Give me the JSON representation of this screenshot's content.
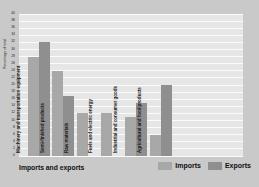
{
  "chart_data": {
    "type": "bar",
    "title": "Imports and exports",
    "xlabel": "",
    "ylabel": "Percentage of total",
    "ylim": [
      0,
      40
    ],
    "ytick_step": 2,
    "yticks": [
      0,
      2,
      4,
      6,
      8,
      10,
      12,
      14,
      16,
      18,
      20,
      22,
      24,
      26,
      28,
      30,
      32,
      34,
      36,
      38,
      40
    ],
    "ytick_labels": [
      "0",
      "2",
      "4",
      "6",
      "8",
      "10",
      "12",
      "14",
      "16",
      "18",
      "20",
      "22",
      "24",
      "26",
      "28",
      "30",
      "32",
      "34",
      "36",
      "38",
      "40"
    ],
    "grid": true,
    "grid_orientation": "horizontal",
    "legend": [
      "Imports",
      "Exports"
    ],
    "legend_position": "bottom-right",
    "categories": [
      "Machinery and transportation equipment",
      "Semi-finished products",
      "Raw materials",
      "Fuels and electric energy",
      "Industrial and consumer goods",
      "Agricultural and food products"
    ],
    "series": [
      {
        "name": "Imports",
        "color": "#a8a8a8",
        "values": [
          28,
          24,
          12,
          12,
          11,
          6
        ]
      },
      {
        "name": "Exports",
        "color": "#8f8f8f",
        "values": [
          32,
          17,
          null,
          null,
          15,
          20
        ]
      }
    ]
  },
  "colors": {
    "figure_background": "#c9c9c9",
    "plot_background": "#e6e6e6",
    "gridline": "#fbfbfb",
    "imports": "#a8a8a8",
    "exports": "#8f8f8f",
    "text": "#101010"
  }
}
